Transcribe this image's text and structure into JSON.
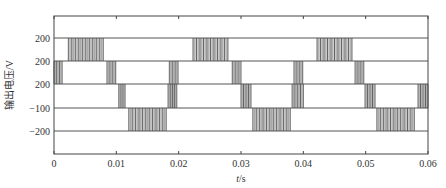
{
  "chart_data": {
    "type": "line",
    "title": "",
    "xlabel": "t/s",
    "xlabel_italic_part": "t",
    "xlabel_unit_part": "/s",
    "ylabel": "输出电压/V",
    "xlim": [
      0,
      0.06
    ],
    "x_ticks": [
      0,
      0.01,
      0.02,
      0.03,
      0.04,
      0.05,
      0.06
    ],
    "x_tick_labels": [
      "0",
      "0.01",
      "0.02",
      "0.03",
      "0.04",
      "0.05",
      "0.06"
    ],
    "y_tick_labels": [
      "200",
      "200",
      "200",
      "-100",
      "-200"
    ],
    "grid": false,
    "legend": null,
    "levels": [
      {
        "label": "200"
      },
      {
        "label": "200"
      },
      {
        "label": "200"
      },
      {
        "label": "-100"
      },
      {
        "label": "-200"
      }
    ],
    "pwm_bands": [
      {
        "row": 0,
        "t_start": 0.0023,
        "t_end": 0.0079,
        "pulses": 10
      },
      {
        "row": 0,
        "t_start": 0.0223,
        "t_end": 0.0279,
        "pulses": 10
      },
      {
        "row": 0,
        "t_start": 0.0422,
        "t_end": 0.0478,
        "pulses": 10
      },
      {
        "row": 1,
        "t_start": 0.0,
        "t_end": 0.0013,
        "pulses": 3
      },
      {
        "row": 1,
        "t_start": 0.0085,
        "t_end": 0.0099,
        "pulses": 3
      },
      {
        "row": 1,
        "t_start": 0.0185,
        "t_end": 0.0199,
        "pulses": 3
      },
      {
        "row": 1,
        "t_start": 0.0286,
        "t_end": 0.03,
        "pulses": 3
      },
      {
        "row": 1,
        "t_start": 0.0385,
        "t_end": 0.0399,
        "pulses": 3
      },
      {
        "row": 1,
        "t_start": 0.0483,
        "t_end": 0.0497,
        "pulses": 3
      },
      {
        "row": 2,
        "t_start": 0.0104,
        "t_end": 0.0114,
        "pulses": 3
      },
      {
        "row": 2,
        "t_start": 0.0183,
        "t_end": 0.0197,
        "pulses": 4
      },
      {
        "row": 2,
        "t_start": 0.03,
        "t_end": 0.0316,
        "pulses": 4
      },
      {
        "row": 2,
        "t_start": 0.0382,
        "t_end": 0.04,
        "pulses": 4
      },
      {
        "row": 2,
        "t_start": 0.0499,
        "t_end": 0.0515,
        "pulses": 4
      },
      {
        "row": 2,
        "t_start": 0.0584,
        "t_end": 0.06,
        "pulses": 4
      },
      {
        "row": 3,
        "t_start": 0.012,
        "t_end": 0.018,
        "pulses": 11
      },
      {
        "row": 3,
        "t_start": 0.0319,
        "t_end": 0.0379,
        "pulses": 11
      },
      {
        "row": 3,
        "t_start": 0.0518,
        "t_end": 0.0578,
        "pulses": 11
      }
    ]
  }
}
